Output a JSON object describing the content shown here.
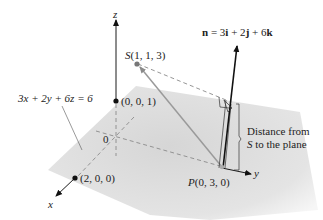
{
  "plane_equation": "3x + 2y + 6z = 6",
  "normal_vector": {
    "prefix": "n",
    "equals": " = 3",
    "i": "i",
    "plus1": " + 2",
    "j": "j",
    "plus2": " + 6",
    "k": "k"
  },
  "points": {
    "S": {
      "name": "S",
      "coords": "(1, 1, 3)"
    },
    "P": {
      "name": "P",
      "coords": "(0, 3, 0)"
    },
    "z_intercept": "(0, 0, 1)",
    "x_intercept": "(2, 0, 0)",
    "origin": "0"
  },
  "axes": {
    "x": "x",
    "y": "y",
    "z": "z"
  },
  "distance_label": {
    "line1": "Distance from",
    "line2_var": "S",
    "line2_rest": " to the plane"
  },
  "colors": {
    "plane": "#dcdcdc",
    "axis": "#1a1a1a",
    "dashed": "#8a8a8a",
    "vector_ps": "#9a9a9a",
    "point": "#111111"
  }
}
